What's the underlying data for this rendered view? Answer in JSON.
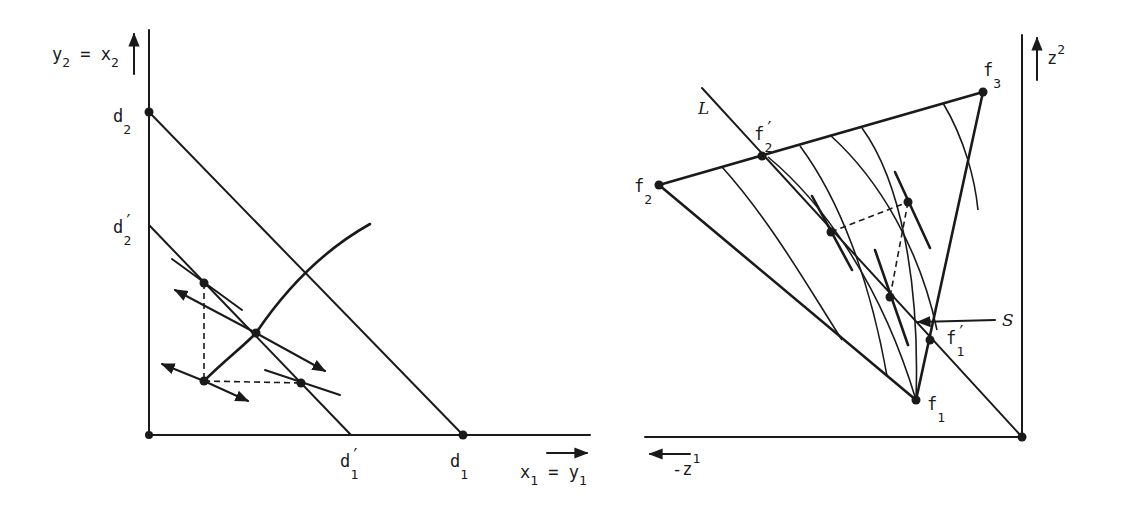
{
  "left_panel": {
    "y_axis_label": "y",
    "y_axis_sub": "2",
    "y_axis_eq": " = x",
    "y_axis_eq_sub": "2",
    "x_axis_label": "x",
    "x_axis_sub": "1",
    "x_axis_eq": " = y",
    "x_axis_eq_sub": "1",
    "points": {
      "d2": {
        "base": "d",
        "sub": "2"
      },
      "d2_prime": {
        "base": "d",
        "prime": "′",
        "sub": "2"
      },
      "d1": {
        "base": "d",
        "sub": "1"
      },
      "d1_prime": {
        "base": "d",
        "prime": "′",
        "sub": "1"
      }
    }
  },
  "right_panel": {
    "y_axis_label": "z",
    "y_axis_sup": "2",
    "x_axis_label": "-z",
    "x_axis_sup": "1",
    "line_L": "L",
    "line_S": "S",
    "points": {
      "f1": {
        "base": "f",
        "sub": "1"
      },
      "f1_prime": {
        "base": "f",
        "prime": "′",
        "sub": "1"
      },
      "f2": {
        "base": "f",
        "sub": "2"
      },
      "f2_prime": {
        "base": "f",
        "prime": "′",
        "sub": "2"
      },
      "f3": {
        "base": "f",
        "sub": "3"
      }
    }
  }
}
